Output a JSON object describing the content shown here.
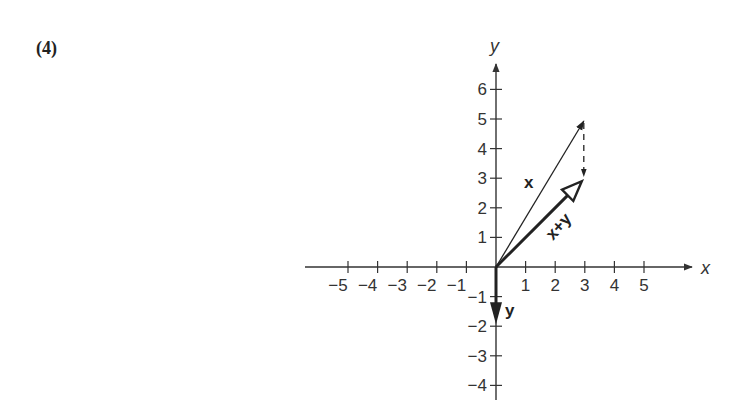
{
  "problem_label": "(4)",
  "chart_data": {
    "type": "vector-diagram",
    "title": "",
    "xlabel": "x",
    "ylabel": "y",
    "xlim": [
      -6,
      7
    ],
    "ylim": [
      -4.5,
      6.5
    ],
    "grid": false,
    "x_ticks": [
      -5,
      -4,
      -3,
      -2,
      -1,
      1,
      2,
      3,
      4,
      5
    ],
    "x_tick_labels": [
      "−5",
      "−4",
      "−3",
      "−2",
      "−1",
      "1",
      "2",
      "3",
      "4",
      "5"
    ],
    "y_ticks": [
      6,
      5,
      4,
      3,
      2,
      1,
      -1,
      -2,
      -3,
      -4
    ],
    "y_tick_labels": [
      "6",
      "5",
      "4",
      "3",
      "2",
      "1",
      "−1",
      "−2",
      "−3",
      "−4"
    ],
    "vectors": [
      {
        "name": "x",
        "label": "x",
        "from": [
          0,
          0
        ],
        "to": [
          3,
          5
        ],
        "style": "thin solid arrow"
      },
      {
        "name": "y",
        "label": "y",
        "from": [
          0,
          0
        ],
        "to": [
          0,
          -2
        ],
        "style": "bold solid arrow, filled head"
      },
      {
        "name": "x+y",
        "label": "x+y",
        "from": [
          0,
          0
        ],
        "to": [
          3,
          3
        ],
        "style": "bold solid arrow, hollow head"
      },
      {
        "name": "y-translated",
        "label": "",
        "from": [
          3,
          5
        ],
        "to": [
          3,
          3
        ],
        "style": "dashed arrow"
      }
    ]
  }
}
